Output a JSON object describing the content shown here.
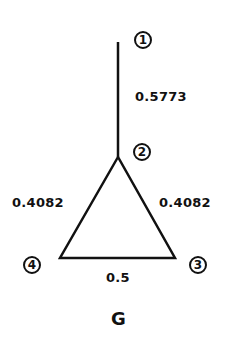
{
  "graph": {
    "name": "G",
    "nodes": [
      {
        "id": "1",
        "label": "1"
      },
      {
        "id": "2",
        "label": "2"
      },
      {
        "id": "3",
        "label": "3"
      },
      {
        "id": "4",
        "label": "4"
      }
    ],
    "edges": [
      {
        "from": "1",
        "to": "2",
        "weight": "0.5773"
      },
      {
        "from": "2",
        "to": "4",
        "weight": "0.4082"
      },
      {
        "from": "2",
        "to": "3",
        "weight": "0.4082"
      },
      {
        "from": "4",
        "to": "3",
        "weight": "0.5"
      }
    ]
  }
}
